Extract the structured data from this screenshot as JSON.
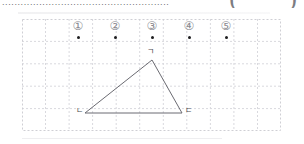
{
  "worksheet": {
    "leader_text": "......................................................",
    "answer_bracket": {
      "open": "(",
      "close": ")"
    }
  },
  "choices": [
    {
      "id": "choice-1",
      "label": "①",
      "marker": "point-dot",
      "x": 56
    },
    {
      "id": "choice-2",
      "label": "②",
      "marker": "point-dot",
      "x": 93
    },
    {
      "id": "choice-3",
      "label": "③",
      "marker": "point-dot",
      "x": 130
    },
    {
      "id": "choice-4",
      "label": "④",
      "marker": "point-dot",
      "x": 167
    },
    {
      "id": "choice-5",
      "label": "⑤",
      "marker": "point-dot",
      "x": 204
    }
  ],
  "figure": {
    "type": "triangle",
    "name": "triangle-gian-nieun-digeut",
    "vertices": [
      {
        "name": "apex",
        "label": "ㄱ",
        "x": 130,
        "y": 41
      },
      {
        "name": "bottom-left",
        "label": "ㄴ",
        "x": 63,
        "y": 94
      },
      {
        "name": "bottom-right",
        "label": "ㄷ",
        "x": 160,
        "y": 94
      }
    ],
    "stroke_color": "#6b6b72",
    "stroke_width": 1
  },
  "grid": {
    "columns": 11,
    "rows": 5,
    "cell_width": 23.5,
    "cell_height": 22.4,
    "line_color": "#d9d9de",
    "border_color": "#cfcfd4",
    "dash_pattern": "2 2"
  },
  "colors": {
    "page_background": "#ffffff",
    "ink": "#1d1d1f",
    "muted_ink": "#6b6b72",
    "grid": "#d9d9de"
  }
}
